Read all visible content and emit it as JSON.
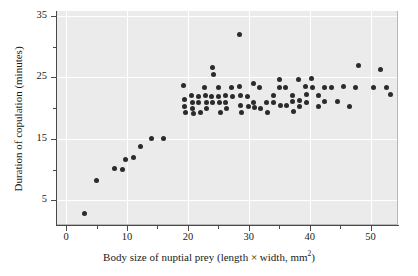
{
  "chart_data": {
    "type": "scatter",
    "title": "",
    "xlabel": "Body size of nuptial prey (length × width, mm",
    "xlabel_sup": "2",
    "xlabel_tail": ")",
    "ylabel": "Duration of copulation (minutes)",
    "xlim": [
      -1.5,
      54.5
    ],
    "ylim": [
      1.0,
      35.8
    ],
    "grid": "white gridlines on gray panel, at major ticks",
    "legend": "none",
    "marker_color": "#2b2b2b",
    "panel_color": "#ebebeb",
    "gridline_color": "#ffffff",
    "xticks": [
      0,
      10,
      20,
      30,
      40,
      50
    ],
    "xtick_labels": [
      "0",
      "10",
      "20",
      "30",
      "40",
      "50"
    ],
    "xticks_minor": [
      5,
      15,
      25,
      35,
      45
    ],
    "yticks": [
      5,
      15,
      25,
      35
    ],
    "ytick_labels": [
      "5",
      "15",
      "25",
      "35"
    ],
    "yticks_minor": [
      10,
      20,
      30
    ],
    "points": [
      [
        3.0,
        2.8
      ],
      [
        5.0,
        8.2
      ],
      [
        8.0,
        10.2
      ],
      [
        9.2,
        10.1
      ],
      [
        9.8,
        11.6
      ],
      [
        11.0,
        12.0
      ],
      [
        12.2,
        13.8
      ],
      [
        14.0,
        15.0
      ],
      [
        16.0,
        15.0
      ],
      [
        19.3,
        23.7
      ],
      [
        19.4,
        21.4
      ],
      [
        19.5,
        20.3
      ],
      [
        19.6,
        19.3
      ],
      [
        20.6,
        22.0
      ],
      [
        20.7,
        21.0
      ],
      [
        20.8,
        20.0
      ],
      [
        20.9,
        19.2
      ],
      [
        21.7,
        21.9
      ],
      [
        21.8,
        20.9
      ],
      [
        22.0,
        19.3
      ],
      [
        22.8,
        23.4
      ],
      [
        22.9,
        22.1
      ],
      [
        23.0,
        21.0
      ],
      [
        23.1,
        20.0
      ],
      [
        23.9,
        21.9
      ],
      [
        24.0,
        20.9
      ],
      [
        24.1,
        26.6
      ],
      [
        24.2,
        25.4
      ],
      [
        25.0,
        23.4
      ],
      [
        25.1,
        21.9
      ],
      [
        25.2,
        20.9
      ],
      [
        25.3,
        19.3
      ],
      [
        26.1,
        22.0
      ],
      [
        26.2,
        21.0
      ],
      [
        26.3,
        20.0
      ],
      [
        27.2,
        23.4
      ],
      [
        27.3,
        21.9
      ],
      [
        28.4,
        32.0
      ],
      [
        28.5,
        23.5
      ],
      [
        28.6,
        22.0
      ],
      [
        28.7,
        20.5
      ],
      [
        28.8,
        19.3
      ],
      [
        29.8,
        21.9
      ],
      [
        29.9,
        20.2
      ],
      [
        30.7,
        24.0
      ],
      [
        30.8,
        21.0
      ],
      [
        30.9,
        20.1
      ],
      [
        31.8,
        23.4
      ],
      [
        31.9,
        20.0
      ],
      [
        32.9,
        21.0
      ],
      [
        33.0,
        19.3
      ],
      [
        34.0,
        22.0
      ],
      [
        34.1,
        21.0
      ],
      [
        35.0,
        24.6
      ],
      [
        35.1,
        23.4
      ],
      [
        35.2,
        20.4
      ],
      [
        36.1,
        23.3
      ],
      [
        36.2,
        20.4
      ],
      [
        37.1,
        22.1
      ],
      [
        37.2,
        21.1
      ],
      [
        37.3,
        19.4
      ],
      [
        38.2,
        24.7
      ],
      [
        38.3,
        21.2
      ],
      [
        38.4,
        20.2
      ],
      [
        39.3,
        23.5
      ],
      [
        39.4,
        22.2
      ],
      [
        39.5,
        21.0
      ],
      [
        40.3,
        24.8
      ],
      [
        40.4,
        23.4
      ],
      [
        41.4,
        22.0
      ],
      [
        41.5,
        20.3
      ],
      [
        42.4,
        23.4
      ],
      [
        42.5,
        21.1
      ],
      [
        43.5,
        23.4
      ],
      [
        44.5,
        21.1
      ],
      [
        45.5,
        23.5
      ],
      [
        46.5,
        20.2
      ],
      [
        47.6,
        23.4
      ],
      [
        48.0,
        26.9
      ],
      [
        50.5,
        23.4
      ],
      [
        51.6,
        26.3
      ],
      [
        52.6,
        23.4
      ],
      [
        53.2,
        22.3
      ]
    ]
  }
}
